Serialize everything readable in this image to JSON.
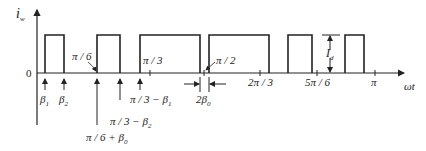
{
  "diagram": {
    "type": "pulse-waveform",
    "y_axis_label": "i",
    "y_axis_label_sub": "w",
    "x_axis_label": "ωt",
    "origin_label": "0",
    "amplitude_label": "I",
    "amplitude_label_sub": "d",
    "colors": {
      "stroke": "#222222",
      "background": "#ffffff"
    },
    "pulses": [
      {
        "start_x": 45,
        "end_x": 64
      },
      {
        "start_x": 97,
        "end_x": 120
      },
      {
        "start_x": 140,
        "end_x": 200
      },
      {
        "start_x": 209,
        "end_x": 269
      },
      {
        "start_x": 288,
        "end_x": 312
      },
      {
        "start_x": 345,
        "end_x": 364
      }
    ],
    "markers": {
      "beta1": {
        "label": "β",
        "sub": "1"
      },
      "beta2": {
        "label": "β",
        "sub": "2"
      },
      "pi6": "π / 6",
      "pi6_beta0": {
        "label": "π / 6 + β",
        "sub": "0"
      },
      "pi3_beta2": {
        "label": "π / 3 − β",
        "sub": "2"
      },
      "pi3_beta1": {
        "label": "π / 3 − β",
        "sub": "1"
      },
      "pi3": "π / 3",
      "pi2": "π / 2",
      "two_beta0": {
        "label": "2β",
        "sub": "0"
      },
      "two_pi3": "2π / 3",
      "five_pi6": "5π / 6",
      "pi": "π"
    }
  }
}
